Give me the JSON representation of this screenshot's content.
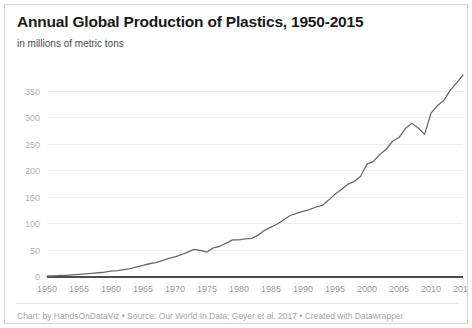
{
  "card": {
    "title": "Annual Global Production of Plastics, 1950-2015",
    "subtitle": "in millions of metric tons",
    "credit": "Chart: by HandsOnDataViz • Source: Our World In Data; Geyer et al. 2017 • Created with Datawrapper",
    "border_color": "#d8d8d8",
    "background_color": "#ffffff"
  },
  "chart_data": {
    "type": "line",
    "title": "Annual Global Production of Plastics, 1950-2015",
    "subtitle": "in millions of metric tons",
    "xlabel": "",
    "ylabel": "",
    "xlim": [
      1950,
      2015
    ],
    "ylim": [
      0,
      381
    ],
    "grid": true,
    "legend_position": "none",
    "line_color": "#6b6b6b",
    "gridline_color": "#ededed",
    "axis_color": "#4d4d4d",
    "ytick_labels": [
      "0",
      "50",
      "100",
      "150",
      "200",
      "250",
      "300",
      "350"
    ],
    "ytick_values": [
      0,
      50,
      100,
      150,
      200,
      250,
      300,
      350
    ],
    "xtick_labels": [
      "1950",
      "1955",
      "1960",
      "1965",
      "1970",
      "1975",
      "1980",
      "1985",
      "1990",
      "1995",
      "2000",
      "2005",
      "2010",
      "2015"
    ],
    "xtick_values": [
      1950,
      1955,
      1960,
      1965,
      1970,
      1975,
      1980,
      1985,
      1990,
      1995,
      2000,
      2005,
      2010,
      2015
    ],
    "x": [
      1950,
      1951,
      1952,
      1953,
      1954,
      1955,
      1956,
      1957,
      1958,
      1959,
      1960,
      1961,
      1962,
      1963,
      1964,
      1965,
      1966,
      1967,
      1968,
      1969,
      1970,
      1971,
      1972,
      1973,
      1974,
      1975,
      1976,
      1977,
      1978,
      1979,
      1980,
      1981,
      1982,
      1983,
      1984,
      1985,
      1986,
      1987,
      1988,
      1989,
      1990,
      1991,
      1992,
      1993,
      1994,
      1995,
      1996,
      1997,
      1998,
      1999,
      2000,
      2001,
      2002,
      2003,
      2004,
      2005,
      2006,
      2007,
      2008,
      2009,
      2010,
      2011,
      2012,
      2013,
      2014,
      2015
    ],
    "values": [
      2,
      2,
      3,
      3,
      4,
      5,
      6,
      7,
      8,
      9,
      11,
      12,
      14,
      16,
      19,
      22,
      25,
      27,
      31,
      35,
      38,
      42,
      47,
      52,
      50,
      47,
      55,
      58,
      64,
      70,
      70,
      72,
      73,
      79,
      88,
      94,
      100,
      108,
      116,
      120,
      124,
      127,
      132,
      135,
      145,
      156,
      165,
      175,
      180,
      190,
      213,
      218,
      231,
      241,
      256,
      263,
      280,
      290,
      281,
      269,
      309,
      323,
      333,
      352,
      366,
      381
    ]
  },
  "icons": {
    "none": ""
  }
}
